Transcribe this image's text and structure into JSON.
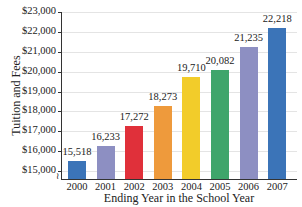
{
  "chart_data": {
    "type": "bar",
    "title": "",
    "xlabel": "Ending Year in the School Year",
    "ylabel": "Tuition and Fees",
    "categories": [
      "2000",
      "2001",
      "2002",
      "2003",
      "2004",
      "2005",
      "2006",
      "2007"
    ],
    "values": [
      15518,
      16233,
      17272,
      18273,
      19710,
      20082,
      21235,
      22218
    ],
    "value_labels": [
      "15,518",
      "16,233",
      "17,272",
      "18,273",
      "19,710",
      "20,082",
      "21,235",
      "22,218"
    ],
    "bar_colors": [
      "#3b74b8",
      "#8d8fc2",
      "#e0303a",
      "#ee9a3c",
      "#f2cc2a",
      "#3fa56b",
      "#8d8fc2",
      "#3b74b8"
    ],
    "yticks": [
      "$15,000",
      "$16,000",
      "$17,000",
      "$18,000",
      "$19,000",
      "$20,000",
      "$21,000",
      "$22,000",
      "$23,000"
    ],
    "ylim": [
      15000,
      23000
    ],
    "axis_break": true,
    "grid": true,
    "legend": null
  }
}
